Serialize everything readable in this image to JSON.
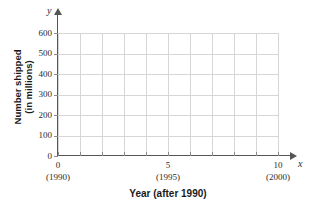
{
  "chart_data": {
    "type": "line",
    "title": "",
    "xlabel": "Year (after 1990)",
    "ylabel_line1": "Number shipped",
    "ylabel_line2": "(in millions)",
    "x_axis_letter": "y",
    "y_axis_letter": "x",
    "xlim": [
      0,
      10
    ],
    "ylim": [
      0,
      600
    ],
    "grid": true,
    "legend": "none",
    "series": [],
    "values": [],
    "x_ticks_major": [
      {
        "value": 0,
        "label": "0",
        "sublabel": "(1990)"
      },
      {
        "value": 5,
        "label": "5",
        "sublabel": "(1995)"
      },
      {
        "value": 10,
        "label": "10",
        "sublabel": "(2000)"
      }
    ],
    "x_gridline_values": [
      0,
      1,
      2,
      3,
      4,
      5,
      6,
      7,
      8,
      9,
      10
    ],
    "y_ticks": [
      {
        "value": 0,
        "label": "0"
      },
      {
        "value": 100,
        "label": "100"
      },
      {
        "value": 200,
        "label": "200"
      },
      {
        "value": 300,
        "label": "300"
      },
      {
        "value": 400,
        "label": "400"
      },
      {
        "value": 500,
        "label": "500"
      },
      {
        "value": 600,
        "label": "600"
      }
    ],
    "colors": {
      "axis": "#555555",
      "grid": "#d6d6d6",
      "text": "#1a1a1a",
      "background": "#ffffff"
    }
  }
}
